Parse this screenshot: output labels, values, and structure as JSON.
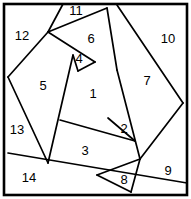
{
  "figure": {
    "width": 191,
    "height": 199,
    "background_color": "#ffffff",
    "line_color": "#000000",
    "border_color": "#000000",
    "label_color": "#000000"
  },
  "regions": [
    {
      "id": "region-1",
      "label": "1",
      "x": 93,
      "y": 95
    },
    {
      "id": "region-2",
      "label": "2",
      "x": 124,
      "y": 130
    },
    {
      "id": "region-3",
      "label": "3",
      "x": 85,
      "y": 152
    },
    {
      "id": "region-4",
      "label": "4",
      "x": 79,
      "y": 60
    },
    {
      "id": "region-5",
      "label": "5",
      "x": 43,
      "y": 87
    },
    {
      "id": "region-6",
      "label": "6",
      "x": 91,
      "y": 40
    },
    {
      "id": "region-7",
      "label": "7",
      "x": 147,
      "y": 82
    },
    {
      "id": "region-8",
      "label": "8",
      "x": 124,
      "y": 181
    },
    {
      "id": "region-9",
      "label": "9",
      "x": 168,
      "y": 172
    },
    {
      "id": "region-10",
      "label": "10",
      "x": 168,
      "y": 40
    },
    {
      "id": "region-11",
      "label": "11",
      "x": 76,
      "y": 12
    },
    {
      "id": "region-12",
      "label": "12",
      "x": 22,
      "y": 37
    },
    {
      "id": "region-13",
      "label": "13",
      "x": 17,
      "y": 131
    },
    {
      "id": "region-14",
      "label": "14",
      "x": 29,
      "y": 179
    }
  ],
  "frame": {
    "x": 4,
    "y": 4,
    "width": 183,
    "height": 191
  },
  "lines": [
    {
      "id": "line-12-5-top",
      "x1": 48,
      "y1": 32,
      "x2": 63,
      "y2": 4
    },
    {
      "id": "line-11-6",
      "x1": 48,
      "y1": 32,
      "x2": 107,
      "y2": 8
    },
    {
      "id": "line-6-4",
      "x1": 48,
      "y1": 32,
      "x2": 95,
      "y2": 62
    },
    {
      "id": "line-5-left-edge",
      "x1": 48,
      "y1": 32,
      "x2": 8,
      "y2": 77
    },
    {
      "id": "line-5-13-lower",
      "x1": 8,
      "y1": 77,
      "x2": 48,
      "y2": 163
    },
    {
      "id": "line-13-14",
      "x1": 8,
      "y1": 153,
      "x2": 187,
      "y2": 183
    },
    {
      "id": "line-4-1-left",
      "x1": 73,
      "y1": 55,
      "x2": 48,
      "y2": 163
    },
    {
      "id": "line-4-short",
      "x1": 73,
      "y1": 55,
      "x2": 78,
      "y2": 71
    },
    {
      "id": "line-4-1-diag",
      "x1": 78,
      "y1": 71,
      "x2": 95,
      "y2": 62
    },
    {
      "id": "line-6-7-right",
      "x1": 107,
      "y1": 8,
      "x2": 117,
      "y2": 70
    },
    {
      "id": "line-7-2-right",
      "x1": 117,
      "y1": 70,
      "x2": 140,
      "y2": 159
    },
    {
      "id": "line-10-7",
      "x1": 117,
      "y1": 5,
      "x2": 183,
      "y2": 103
    },
    {
      "id": "line-9-right",
      "x1": 183,
      "y1": 103,
      "x2": 140,
      "y2": 159
    },
    {
      "id": "line-9-bottom",
      "x1": 140,
      "y1": 159,
      "x2": 131,
      "y2": 192
    },
    {
      "id": "line-1-3",
      "x1": 60,
      "y1": 120,
      "x2": 135,
      "y2": 141
    },
    {
      "id": "line-2-top",
      "x1": 108,
      "y1": 118,
      "x2": 135,
      "y2": 141
    },
    {
      "id": "line-3-8",
      "x1": 97,
      "y1": 175,
      "x2": 140,
      "y2": 159
    },
    {
      "id": "line-8-bottom",
      "x1": 97,
      "y1": 175,
      "x2": 131,
      "y2": 192
    }
  ]
}
